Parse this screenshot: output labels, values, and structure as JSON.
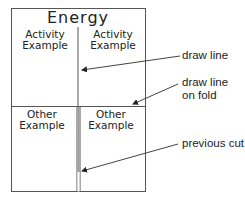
{
  "diagram": {
    "title": "Energy",
    "cells": {
      "top_left": {
        "line1": "Activity",
        "line2": "Example"
      },
      "top_right": {
        "line1": "Activity",
        "line2": "Example"
      },
      "bottom_left": {
        "line1": "Other",
        "line2": "Example"
      },
      "bottom_right": {
        "line1": "Other",
        "line2": "Example"
      }
    },
    "callouts": {
      "draw_line": "draw line",
      "draw_line_on_fold_1": "draw line",
      "draw_line_on_fold_2": "on fold",
      "previous_cut": "previous cut"
    },
    "colors": {
      "line": "#555555",
      "text": "#222222",
      "background": "#ffffff"
    }
  }
}
